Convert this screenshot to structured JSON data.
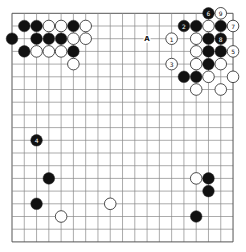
{
  "board": {
    "size": 19,
    "origin_x": 12,
    "origin_y": 13.3,
    "spacing_x": 12.28,
    "spacing_y": 12.7,
    "line_color": "#888888",
    "border_color": "#555555",
    "black_color": "#111111",
    "white_color": "#ffffff",
    "stone_radius": 5.8
  },
  "stones": [
    {
      "color": "black",
      "col": 1,
      "row": 1,
      "label": ""
    },
    {
      "color": "black",
      "col": 2,
      "row": 1,
      "label": ""
    },
    {
      "color": "white",
      "col": 3,
      "row": 1,
      "label": ""
    },
    {
      "color": "white",
      "col": 4,
      "row": 1,
      "label": ""
    },
    {
      "color": "black",
      "col": 5,
      "row": 1,
      "label": ""
    },
    {
      "color": "white",
      "col": 6,
      "row": 1,
      "label": ""
    },
    {
      "color": "black",
      "col": 0,
      "row": 2,
      "label": ""
    },
    {
      "color": "black",
      "col": 2,
      "row": 2,
      "label": ""
    },
    {
      "color": "black",
      "col": 3,
      "row": 2,
      "label": ""
    },
    {
      "color": "black",
      "col": 4,
      "row": 2,
      "label": ""
    },
    {
      "color": "white",
      "col": 5,
      "row": 2,
      "label": ""
    },
    {
      "color": "white",
      "col": 6,
      "row": 2,
      "label": ""
    },
    {
      "color": "black",
      "col": 1,
      "row": 3,
      "label": ""
    },
    {
      "color": "white",
      "col": 2,
      "row": 3,
      "label": ""
    },
    {
      "color": "white",
      "col": 3,
      "row": 3,
      "label": ""
    },
    {
      "color": "white",
      "col": 4,
      "row": 3,
      "label": ""
    },
    {
      "color": "black",
      "col": 5,
      "row": 3,
      "label": ""
    },
    {
      "color": "white",
      "col": 5,
      "row": 4,
      "label": ""
    },
    {
      "color": "black",
      "col": 16,
      "row": 0,
      "label": "6"
    },
    {
      "color": "white",
      "col": 17,
      "row": 0,
      "label": "9"
    },
    {
      "color": "black",
      "col": 14,
      "row": 1,
      "label": "2"
    },
    {
      "color": "black",
      "col": 15,
      "row": 1,
      "label": ""
    },
    {
      "color": "white",
      "col": 16,
      "row": 1,
      "label": ""
    },
    {
      "color": "black",
      "col": 17,
      "row": 1,
      "label": ""
    },
    {
      "color": "white",
      "col": 18,
      "row": 1,
      "label": "7"
    },
    {
      "color": "white",
      "col": 13,
      "row": 2,
      "label": "1"
    },
    {
      "color": "white",
      "col": 15,
      "row": 2,
      "label": ""
    },
    {
      "color": "black",
      "col": 16,
      "row": 2,
      "label": ""
    },
    {
      "color": "black",
      "col": 17,
      "row": 2,
      "label": "8"
    },
    {
      "color": "white",
      "col": 15,
      "row": 3,
      "label": ""
    },
    {
      "color": "black",
      "col": 16,
      "row": 3,
      "label": ""
    },
    {
      "color": "black",
      "col": 17,
      "row": 3,
      "label": ""
    },
    {
      "color": "white",
      "col": 18,
      "row": 3,
      "label": "5"
    },
    {
      "color": "white",
      "col": 13,
      "row": 4,
      "label": "3"
    },
    {
      "color": "white",
      "col": 15,
      "row": 4,
      "label": ""
    },
    {
      "color": "black",
      "col": 16,
      "row": 4,
      "label": ""
    },
    {
      "color": "white",
      "col": 17,
      "row": 4,
      "label": ""
    },
    {
      "color": "black",
      "col": 14,
      "row": 5,
      "label": ""
    },
    {
      "color": "black",
      "col": 15,
      "row": 5,
      "label": ""
    },
    {
      "color": "white",
      "col": 16,
      "row": 5,
      "label": ""
    },
    {
      "color": "white",
      "col": 18,
      "row": 5,
      "label": ""
    },
    {
      "color": "white",
      "col": 15,
      "row": 6,
      "label": ""
    },
    {
      "color": "white",
      "col": 17,
      "row": 6,
      "label": ""
    },
    {
      "color": "black",
      "col": 2,
      "row": 10,
      "label": "4"
    },
    {
      "color": "black",
      "col": 3,
      "row": 13,
      "label": ""
    },
    {
      "color": "black",
      "col": 2,
      "row": 15,
      "label": ""
    },
    {
      "color": "white",
      "col": 4,
      "row": 16,
      "label": ""
    },
    {
      "color": "white",
      "col": 8,
      "row": 15,
      "label": ""
    },
    {
      "color": "white",
      "col": 15,
      "row": 13,
      "label": ""
    },
    {
      "color": "black",
      "col": 16,
      "row": 13,
      "label": ""
    },
    {
      "color": "black",
      "col": 16,
      "row": 14,
      "label": ""
    },
    {
      "color": "black",
      "col": 15,
      "row": 16,
      "label": ""
    }
  ],
  "markers": [
    {
      "label": "A",
      "col": 11,
      "row": 2
    }
  ]
}
